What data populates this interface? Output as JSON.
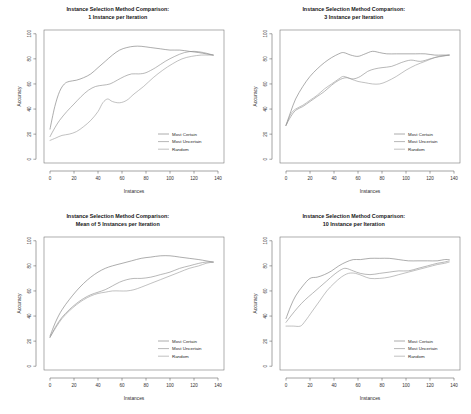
{
  "figure": {
    "background": "#ffffff",
    "panel_count": 4,
    "series_colors": {
      "most_certain": "#7a7a7a",
      "most_uncertain": "#8c8c8c",
      "random": "#9a9a9a"
    }
  },
  "chart_data": [
    {
      "type": "line",
      "title": "Instance Selection Method Comparison:\n1 Instance per Iteration",
      "title_line1": "Instance Selection Method Comparison:",
      "title_line2": "1 Instance per Iteration",
      "xlabel": "Instances",
      "ylabel": "Accuracy",
      "xlim": [
        -5,
        145
      ],
      "ylim": [
        -3,
        103
      ],
      "xticks": [
        0,
        20,
        40,
        60,
        80,
        100,
        120,
        140
      ],
      "yticks": [
        0,
        20,
        40,
        60,
        80,
        100
      ],
      "grid": false,
      "legend_position": "bottom-right",
      "legend": [
        "Most Certain",
        "Most Uncertain",
        "Random"
      ],
      "series": [
        {
          "name": "Most Certain",
          "color": "#7a7a7a",
          "x": [
            0,
            4,
            8,
            12,
            16,
            22,
            28,
            34,
            40,
            46,
            52,
            58,
            64,
            70,
            76,
            84,
            92,
            100,
            108,
            116,
            124,
            130,
            136
          ],
          "y": [
            24,
            42,
            54,
            60,
            62,
            63,
            65,
            68,
            73,
            78,
            83,
            87,
            89,
            90,
            90,
            89,
            88,
            87,
            87,
            86,
            85,
            84,
            83
          ]
        },
        {
          "name": "Most Uncertain",
          "color": "#8c8c8c",
          "x": [
            0,
            4,
            8,
            14,
            20,
            26,
            32,
            38,
            44,
            50,
            56,
            62,
            68,
            74,
            80,
            88,
            96,
            104,
            112,
            120,
            128,
            136
          ],
          "y": [
            18,
            25,
            31,
            38,
            44,
            50,
            55,
            58,
            59,
            60,
            63,
            66,
            68,
            68,
            69,
            73,
            78,
            82,
            85,
            86,
            85,
            83
          ]
        },
        {
          "name": "Random",
          "color": "#9a9a9a",
          "x": [
            0,
            5,
            10,
            16,
            22,
            28,
            34,
            40,
            44,
            48,
            52,
            58,
            64,
            70,
            78,
            86,
            94,
            102,
            110,
            118,
            126,
            132,
            136
          ],
          "y": [
            15,
            17,
            19,
            20,
            22,
            26,
            31,
            38,
            45,
            48,
            46,
            45,
            47,
            52,
            58,
            65,
            71,
            76,
            80,
            82,
            83,
            83,
            83
          ]
        }
      ]
    },
    {
      "type": "line",
      "title": "Instance Selection Method Comparison:\n3 Instance per Iteration",
      "title_line1": "Instance Selection Method Comparison:",
      "title_line2": "3 Instance per Iteration",
      "xlabel": "Instances",
      "ylabel": "Accuracy",
      "xlim": [
        -5,
        145
      ],
      "ylim": [
        -3,
        103
      ],
      "xticks": [
        0,
        20,
        40,
        60,
        80,
        100,
        120,
        140
      ],
      "yticks": [
        0,
        20,
        40,
        60,
        80,
        100
      ],
      "grid": false,
      "legend_position": "bottom-right",
      "legend": [
        "Most Certain",
        "Most Uncertain",
        "Random"
      ],
      "series": [
        {
          "name": "Most Certain",
          "color": "#7a7a7a",
          "x": [
            0,
            4,
            8,
            14,
            20,
            26,
            32,
            38,
            44,
            48,
            54,
            60,
            66,
            72,
            78,
            84,
            92,
            100,
            108,
            116,
            124,
            130,
            136
          ],
          "y": [
            27,
            38,
            48,
            58,
            66,
            72,
            77,
            81,
            84,
            85,
            83,
            82,
            84,
            86,
            85,
            84,
            84,
            84,
            84,
            84,
            83,
            83,
            83
          ]
        },
        {
          "name": "Most Uncertain",
          "color": "#8c8c8c",
          "x": [
            0,
            4,
            8,
            14,
            20,
            26,
            32,
            38,
            44,
            50,
            56,
            62,
            68,
            74,
            80,
            88,
            96,
            104,
            112,
            120,
            128,
            136
          ],
          "y": [
            27,
            34,
            39,
            42,
            46,
            50,
            54,
            59,
            63,
            65,
            64,
            66,
            70,
            72,
            73,
            74,
            77,
            79,
            78,
            80,
            82,
            83
          ]
        },
        {
          "name": "Random",
          "color": "#9a9a9a",
          "x": [
            0,
            4,
            8,
            14,
            20,
            26,
            32,
            38,
            44,
            48,
            54,
            60,
            66,
            72,
            78,
            84,
            92,
            100,
            108,
            116,
            124,
            130,
            136
          ],
          "y": [
            27,
            36,
            40,
            43,
            47,
            51,
            56,
            60,
            64,
            66,
            64,
            62,
            61,
            60,
            60,
            62,
            66,
            71,
            75,
            78,
            81,
            82,
            83
          ]
        }
      ]
    },
    {
      "type": "line",
      "title": "Instance Selection Method Comparison:\nMean of 5 Instances per Iteration",
      "title_line1": "Instance Selection Method Comparison:",
      "title_line2": "Mean of 5 Instances per Iteration",
      "xlabel": "Instances",
      "ylabel": "Accuracy",
      "xlim": [
        -5,
        145
      ],
      "ylim": [
        -3,
        103
      ],
      "xticks": [
        0,
        20,
        40,
        60,
        80,
        100,
        120,
        140
      ],
      "yticks": [
        0,
        20,
        40,
        60,
        80,
        100
      ],
      "grid": false,
      "legend_position": "bottom-right",
      "legend": [
        "Most Certain",
        "Most Uncertain",
        "Random"
      ],
      "series": [
        {
          "name": "Most Certain",
          "color": "#7a7a7a",
          "x": [
            0,
            5,
            10,
            16,
            22,
            28,
            34,
            40,
            46,
            52,
            60,
            68,
            76,
            84,
            92,
            100,
            108,
            116,
            124,
            130,
            136
          ],
          "y": [
            24,
            36,
            45,
            53,
            60,
            66,
            71,
            75,
            78,
            80,
            82,
            84,
            86,
            87,
            88,
            88,
            87,
            86,
            85,
            84,
            83
          ]
        },
        {
          "name": "Most Uncertain",
          "color": "#8c8c8c",
          "x": [
            0,
            5,
            10,
            16,
            22,
            28,
            34,
            40,
            46,
            52,
            58,
            64,
            70,
            76,
            84,
            92,
            100,
            108,
            116,
            124,
            130,
            136
          ],
          "y": [
            23,
            32,
            39,
            45,
            50,
            54,
            57,
            59,
            61,
            64,
            67,
            69,
            70,
            70,
            71,
            73,
            75,
            78,
            80,
            82,
            83,
            83
          ]
        },
        {
          "name": "Random",
          "color": "#9a9a9a",
          "x": [
            0,
            5,
            10,
            16,
            22,
            28,
            34,
            40,
            46,
            52,
            58,
            64,
            70,
            76,
            84,
            92,
            100,
            108,
            116,
            124,
            130,
            136
          ],
          "y": [
            23,
            31,
            38,
            44,
            49,
            53,
            56,
            58,
            59,
            60,
            60,
            60,
            61,
            63,
            66,
            69,
            72,
            75,
            78,
            80,
            82,
            83
          ]
        }
      ]
    },
    {
      "type": "line",
      "title": "Instance Selection Method Comparison:\n10 Instance per Iteration",
      "title_line1": "Instance Selection Method Comparison:",
      "title_line2": "10 Instance per Iteration",
      "xlabel": "Instances",
      "ylabel": "Accuracy",
      "xlim": [
        -5,
        145
      ],
      "ylim": [
        -3,
        103
      ],
      "xticks": [
        0,
        20,
        40,
        60,
        80,
        100,
        120,
        140
      ],
      "yticks": [
        0,
        20,
        40,
        60,
        80,
        100
      ],
      "grid": false,
      "legend_position": "bottom-right",
      "legend": [
        "Most Certain",
        "Most Uncertain",
        "Random"
      ],
      "series": [
        {
          "name": "Most Certain",
          "color": "#7a7a7a",
          "x": [
            0,
            4,
            8,
            14,
            20,
            26,
            32,
            38,
            44,
            50,
            56,
            62,
            70,
            78,
            86,
            94,
            102,
            110,
            118,
            126,
            132,
            136
          ],
          "y": [
            38,
            48,
            56,
            64,
            70,
            71,
            73,
            76,
            80,
            83,
            85,
            85,
            86,
            86,
            86,
            85,
            84,
            84,
            84,
            84,
            85,
            85
          ]
        },
        {
          "name": "Most Uncertain",
          "color": "#8c8c8c",
          "x": [
            0,
            4,
            10,
            16,
            22,
            28,
            34,
            40,
            46,
            50,
            56,
            62,
            70,
            78,
            86,
            94,
            102,
            110,
            118,
            126,
            132,
            136
          ],
          "y": [
            35,
            40,
            47,
            53,
            58,
            63,
            68,
            73,
            77,
            78,
            76,
            74,
            73,
            74,
            75,
            76,
            76,
            78,
            80,
            82,
            83,
            84
          ]
        },
        {
          "name": "Random",
          "color": "#9a9a9a",
          "x": [
            0,
            6,
            12,
            16,
            22,
            28,
            34,
            40,
            46,
            52,
            58,
            64,
            70,
            78,
            86,
            94,
            102,
            110,
            118,
            126,
            132,
            136
          ],
          "y": [
            32,
            32,
            32,
            36,
            44,
            52,
            60,
            66,
            71,
            74,
            74,
            72,
            70,
            70,
            71,
            73,
            75,
            77,
            79,
            81,
            82,
            83
          ]
        }
      ]
    }
  ]
}
